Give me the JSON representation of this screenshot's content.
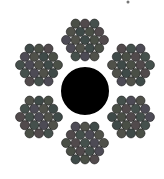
{
  "diagram": {
    "type": "wire-rope-cross-section",
    "background": "#ffffff",
    "core": {
      "cx": 85,
      "cy": 91,
      "r": 25,
      "color": "#000000"
    },
    "wire_radius": 4.6,
    "wire_colors": [
      "#4a4f46",
      "#514a4c",
      "#45504c",
      "#4d4b55",
      "#50514a",
      "#3f4a48"
    ],
    "wire_stroke": "#1a1a1a",
    "strands": [
      {
        "name": "top",
        "cx": 85,
        "cy": 40
      },
      {
        "name": "upper-right",
        "cx": 131,
        "cy": 65
      },
      {
        "name": "lower-right",
        "cx": 131,
        "cy": 117
      },
      {
        "name": "bottom",
        "cx": 85,
        "cy": 143
      },
      {
        "name": "lower-left",
        "cx": 39,
        "cy": 117
      },
      {
        "name": "upper-left",
        "cx": 39,
        "cy": 65
      }
    ],
    "strand_rows": [
      3,
      4,
      5,
      4,
      3
    ],
    "speck": {
      "cx": 128,
      "cy": 2,
      "r": 1.5,
      "color": "#777777"
    }
  }
}
